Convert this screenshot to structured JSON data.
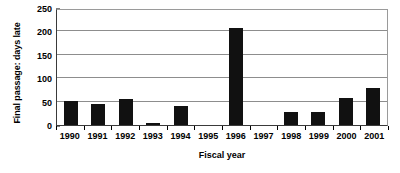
{
  "chart_data": {
    "type": "bar",
    "title": "",
    "xlabel": "Fiscal year",
    "ylabel": "Final passage: days late",
    "categories": [
      "1990",
      "1991",
      "1992",
      "1993",
      "1994",
      "1995",
      "1996",
      "1997",
      "1998",
      "1999",
      "2000",
      "2001"
    ],
    "values": [
      52,
      45,
      55,
      5,
      41,
      0,
      208,
      0,
      27,
      27,
      58,
      80
    ],
    "ylim": [
      0,
      250
    ],
    "yticks": [
      0,
      50,
      100,
      150,
      200,
      250
    ],
    "ytick_labels": [
      "0",
      "50",
      "100",
      "150",
      "200",
      "250"
    ],
    "grid": true,
    "legend": "none",
    "series": [
      {
        "name": "days late",
        "values": [
          52,
          45,
          55,
          5,
          41,
          0,
          208,
          0,
          27,
          27,
          58,
          80
        ],
        "color": "#111111"
      }
    ]
  },
  "colors": {
    "bar": "#111111",
    "gridline": "#8d8d8d",
    "axis": "#3a3a3a",
    "frame": "#9a9a9a",
    "background": "#ffffff",
    "text": "#000000"
  }
}
